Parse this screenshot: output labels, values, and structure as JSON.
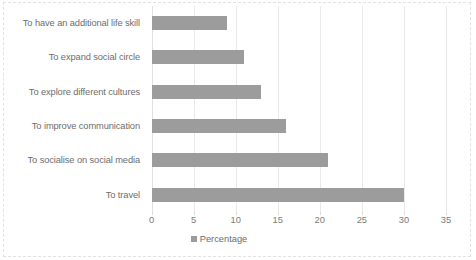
{
  "chart_data": {
    "type": "bar",
    "orientation": "horizontal",
    "title": "",
    "xlabel": "",
    "ylabel": "",
    "xlim": [
      0,
      35
    ],
    "xticks": [
      "0",
      "5",
      "10",
      "15",
      "20",
      "25",
      "30",
      "35"
    ],
    "grid": true,
    "legend_position": "bottom",
    "legend": [
      "Percentage"
    ],
    "bar_color": "#9c9c9c",
    "categories": [
      "To have an additional life skill",
      "To expand social circle",
      "To explore different cultures",
      "To improve communication",
      "To socialise on social media",
      "To travel"
    ],
    "values": [
      9,
      11,
      13,
      16,
      21,
      30
    ],
    "series": [
      {
        "name": "Percentage",
        "values": [
          9,
          11,
          13,
          16,
          21,
          30
        ]
      }
    ]
  }
}
